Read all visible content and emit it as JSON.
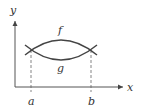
{
  "diagram": {
    "axes": {
      "x_label": "x",
      "y_label": "y"
    },
    "curves": [
      {
        "name": "f",
        "label": "f",
        "shape": "concave-down arc (upper)"
      },
      {
        "name": "g",
        "label": "g",
        "shape": "concave-up arc (lower)"
      }
    ],
    "intersections": [
      {
        "label": "a"
      },
      {
        "label": "b"
      }
    ],
    "colors": {
      "line": "#444444",
      "dashed": "#666666",
      "text": "#333333"
    }
  }
}
